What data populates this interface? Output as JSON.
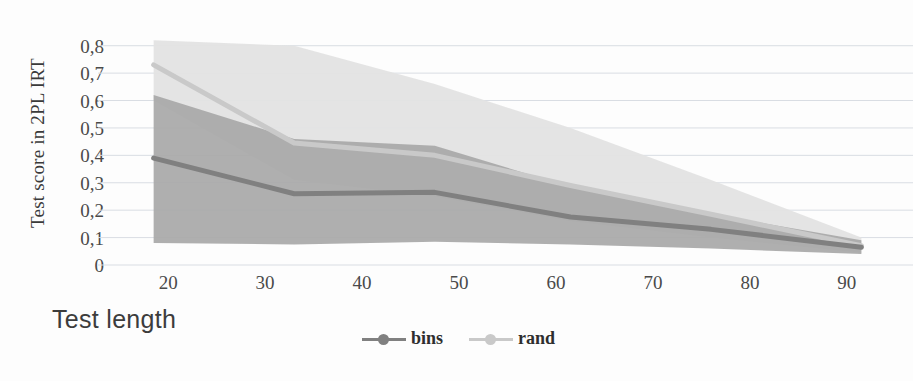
{
  "chart_data": {
    "type": "line",
    "title": "",
    "xlabel": "Test length",
    "ylabel": "Test score in 2PL IRT",
    "xlim": [
      14,
      96
    ],
    "ylim": [
      0,
      0.85
    ],
    "xticks": [
      20,
      30,
      40,
      50,
      60,
      70,
      80,
      90
    ],
    "xtick_labels": [
      "20",
      "30",
      "40",
      "50",
      "60",
      "70",
      "80",
      "90"
    ],
    "yticks": [
      0,
      0.1,
      0.2,
      0.3,
      0.4,
      0.5,
      0.6,
      0.7,
      0.8
    ],
    "ytick_labels": [
      "0",
      "0,1",
      "0,2",
      "0,3",
      "0,4",
      "0,5",
      "0,6",
      "0,7",
      "0,8"
    ],
    "grid": true,
    "grid_axis": "y",
    "legend_position": "bottom-center",
    "x": [
      18.5,
      33,
      47.5,
      61.5,
      76,
      91.5
    ],
    "series": [
      {
        "name": "bins",
        "color": "#808080",
        "band_color": "#a8a8a8",
        "values": [
          0.39,
          0.26,
          0.265,
          0.175,
          0.13,
          0.065
        ],
        "band_upper": [
          0.62,
          0.46,
          0.435,
          0.285,
          0.185,
          0.09
        ],
        "band_lower": [
          0.08,
          0.075,
          0.085,
          0.075,
          0.06,
          0.04
        ]
      },
      {
        "name": "rand",
        "color": "#c9c9c9",
        "band_color": "#e3e3e3",
        "values": [
          0.73,
          0.445,
          0.4,
          0.29,
          0.185,
          0.07
        ],
        "band_upper": [
          0.82,
          0.8,
          0.66,
          0.5,
          0.31,
          0.1
        ],
        "band_lower": [
          0.6,
          0.31,
          0.25,
          0.16,
          0.1,
          0.045
        ]
      }
    ]
  },
  "axes": {
    "y_title": "Test score in 2PL IRT",
    "x_title": "Test length"
  },
  "legend": {
    "items": [
      {
        "label": "bins",
        "color": "#808080"
      },
      {
        "label": "rand",
        "color": "#c9c9c9"
      }
    ]
  }
}
